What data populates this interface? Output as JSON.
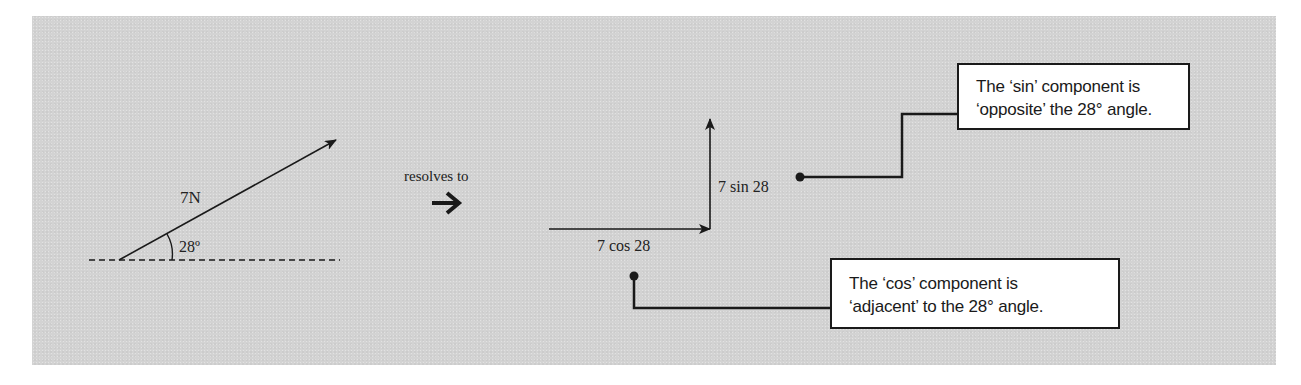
{
  "original_force": {
    "magnitude_label": "7N",
    "angle_label": "28º"
  },
  "transition": {
    "label": "resolves to",
    "arrow_icon": "➔"
  },
  "components": {
    "horizontal_label": "7 cos 28",
    "vertical_label": "7 sin 28"
  },
  "callouts": {
    "sin": {
      "line1": "The ‘sin’ component is",
      "line2": "‘opposite’ the 28° angle."
    },
    "cos": {
      "line1": "The ‘cos’ component is",
      "line2": "‘adjacent’ to the 28° angle."
    }
  },
  "colors": {
    "background_panel": "#d3d3d3",
    "ink": "#1a1a1a",
    "callout_fill": "#ffffff"
  }
}
